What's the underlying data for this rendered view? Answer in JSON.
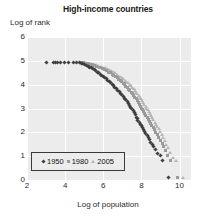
{
  "chart_data": {
    "type": "scatter",
    "title": "High-income countries",
    "xlabel": "Log of population",
    "ylabel": "Log of rank",
    "xlim": [
      2,
      10.6
    ],
    "ylim": [
      0,
      6
    ],
    "xticks": [
      "2",
      "4",
      "6",
      "8",
      "10"
    ],
    "xtick_values": [
      2,
      4,
      6,
      8,
      10
    ],
    "yticks": [
      "0",
      "1",
      "2",
      "3",
      "4",
      "5",
      "6"
    ],
    "ytick_values": [
      0,
      1,
      2,
      3,
      4,
      5,
      6
    ],
    "grid": true,
    "legend_position": "bottom-left",
    "plot_background": "#ececec",
    "gridline_color": "#ffffff",
    "series": [
      {
        "name": "1950",
        "marker": "diamond",
        "color": "#3f3f3f",
        "points": [
          [
            3.02,
            4.93
          ],
          [
            3.38,
            4.93
          ],
          [
            3.5,
            4.93
          ],
          [
            3.62,
            4.93
          ],
          [
            3.75,
            4.93
          ],
          [
            3.95,
            4.93
          ],
          [
            4.18,
            4.93
          ],
          [
            4.42,
            4.93
          ],
          [
            4.62,
            4.93
          ],
          [
            4.74,
            4.92
          ],
          [
            4.84,
            4.9
          ],
          [
            4.93,
            4.87
          ],
          [
            5.02,
            4.84
          ],
          [
            5.12,
            4.81
          ],
          [
            5.2,
            4.78
          ],
          [
            5.29,
            4.74
          ],
          [
            5.37,
            4.7
          ],
          [
            5.45,
            4.66
          ],
          [
            5.53,
            4.62
          ],
          [
            5.61,
            4.58
          ],
          [
            5.69,
            4.53
          ],
          [
            5.77,
            4.49
          ],
          [
            5.85,
            4.44
          ],
          [
            5.93,
            4.39
          ],
          [
            6.0,
            4.34
          ],
          [
            6.08,
            4.29
          ],
          [
            6.16,
            4.24
          ],
          [
            6.23,
            4.18
          ],
          [
            6.31,
            4.13
          ],
          [
            6.38,
            4.07
          ],
          [
            6.46,
            4.01
          ],
          [
            6.53,
            3.95
          ],
          [
            6.61,
            3.89
          ],
          [
            6.68,
            3.83
          ],
          [
            6.76,
            3.77
          ],
          [
            6.83,
            3.7
          ],
          [
            6.9,
            3.64
          ],
          [
            6.97,
            3.57
          ],
          [
            7.04,
            3.5
          ],
          [
            7.11,
            3.43
          ],
          [
            7.18,
            3.36
          ],
          [
            7.25,
            3.29
          ],
          [
            7.31,
            3.21
          ],
          [
            7.38,
            3.14
          ],
          [
            7.44,
            3.06
          ],
          [
            7.5,
            2.98
          ],
          [
            7.56,
            2.9
          ],
          [
            7.62,
            2.82
          ],
          [
            7.67,
            2.73
          ],
          [
            7.72,
            2.64
          ],
          [
            7.77,
            2.56
          ],
          [
            7.82,
            2.48
          ],
          [
            7.88,
            2.41
          ],
          [
            7.94,
            2.34
          ],
          [
            8.0,
            2.27
          ],
          [
            8.06,
            2.2
          ],
          [
            8.12,
            2.12
          ],
          [
            8.18,
            2.04
          ],
          [
            8.24,
            1.95
          ],
          [
            8.3,
            1.86
          ],
          [
            8.36,
            1.77
          ],
          [
            8.42,
            1.68
          ],
          [
            8.48,
            1.59
          ],
          [
            8.56,
            1.49
          ],
          [
            8.64,
            1.4
          ],
          [
            8.74,
            1.3
          ],
          [
            8.86,
            1.1
          ],
          [
            9.0,
            1.02
          ],
          [
            9.12,
            0.83
          ],
          [
            9.4,
            0.1
          ]
        ]
      },
      {
        "name": "1980",
        "marker": "square",
        "color": "#9a9a9a",
        "points": [
          [
            4.8,
            4.93
          ],
          [
            4.95,
            4.92
          ],
          [
            5.08,
            4.9
          ],
          [
            5.2,
            4.88
          ],
          [
            5.32,
            4.86
          ],
          [
            5.44,
            4.83
          ],
          [
            5.56,
            4.8
          ],
          [
            5.67,
            4.77
          ],
          [
            5.78,
            4.74
          ],
          [
            5.88,
            4.7
          ],
          [
            5.98,
            4.66
          ],
          [
            6.08,
            4.62
          ],
          [
            6.18,
            4.58
          ],
          [
            6.28,
            4.53
          ],
          [
            6.37,
            4.49
          ],
          [
            6.46,
            4.44
          ],
          [
            6.55,
            4.39
          ],
          [
            6.63,
            4.34
          ],
          [
            6.72,
            4.29
          ],
          [
            6.8,
            4.23
          ],
          [
            6.88,
            4.18
          ],
          [
            6.96,
            4.12
          ],
          [
            7.04,
            4.06
          ],
          [
            7.12,
            4.0
          ],
          [
            7.19,
            3.94
          ],
          [
            7.26,
            3.88
          ],
          [
            7.33,
            3.81
          ],
          [
            7.4,
            3.75
          ],
          [
            7.47,
            3.68
          ],
          [
            7.54,
            3.61
          ],
          [
            7.6,
            3.54
          ],
          [
            7.66,
            3.47
          ],
          [
            7.72,
            3.4
          ],
          [
            7.78,
            3.33
          ],
          [
            7.84,
            3.25
          ],
          [
            7.9,
            3.18
          ],
          [
            7.96,
            3.1
          ],
          [
            8.01,
            3.02
          ],
          [
            8.07,
            2.94
          ],
          [
            8.12,
            2.86
          ],
          [
            8.18,
            2.78
          ],
          [
            8.24,
            2.7
          ],
          [
            8.3,
            2.62
          ],
          [
            8.36,
            2.54
          ],
          [
            8.42,
            2.46
          ],
          [
            8.48,
            2.37
          ],
          [
            8.55,
            2.28
          ],
          [
            8.62,
            2.19
          ],
          [
            8.69,
            2.1
          ],
          [
            8.76,
            2.0
          ],
          [
            8.84,
            1.9
          ],
          [
            8.92,
            1.79
          ],
          [
            9.0,
            1.67
          ],
          [
            9.08,
            1.54
          ],
          [
            9.16,
            1.4
          ],
          [
            9.24,
            1.25
          ],
          [
            9.36,
            1.02
          ],
          [
            9.52,
            0.83
          ],
          [
            9.9,
            0.1
          ]
        ]
      },
      {
        "name": "2005",
        "marker": "triangle",
        "color": "#b4b4b4",
        "points": [
          [
            4.9,
            4.93
          ],
          [
            5.05,
            4.92
          ],
          [
            5.2,
            4.9
          ],
          [
            5.34,
            4.88
          ],
          [
            5.47,
            4.86
          ],
          [
            5.6,
            4.83
          ],
          [
            5.72,
            4.8
          ],
          [
            5.84,
            4.77
          ],
          [
            5.96,
            4.74
          ],
          [
            6.07,
            4.7
          ],
          [
            6.18,
            4.66
          ],
          [
            6.29,
            4.62
          ],
          [
            6.39,
            4.58
          ],
          [
            6.49,
            4.54
          ],
          [
            6.59,
            4.49
          ],
          [
            6.68,
            4.44
          ],
          [
            6.77,
            4.4
          ],
          [
            6.86,
            4.35
          ],
          [
            6.95,
            4.29
          ],
          [
            7.03,
            4.24
          ],
          [
            7.11,
            4.18
          ],
          [
            7.19,
            4.13
          ],
          [
            7.27,
            4.07
          ],
          [
            7.35,
            4.01
          ],
          [
            7.42,
            3.95
          ],
          [
            7.49,
            3.89
          ],
          [
            7.56,
            3.83
          ],
          [
            7.63,
            3.76
          ],
          [
            7.7,
            3.69
          ],
          [
            7.76,
            3.62
          ],
          [
            7.83,
            3.55
          ],
          [
            7.89,
            3.48
          ],
          [
            7.95,
            3.41
          ],
          [
            8.01,
            3.34
          ],
          [
            8.07,
            3.26
          ],
          [
            8.13,
            3.18
          ],
          [
            8.19,
            3.1
          ],
          [
            8.24,
            3.02
          ],
          [
            8.3,
            2.94
          ],
          [
            8.36,
            2.86
          ],
          [
            8.42,
            2.78
          ],
          [
            8.48,
            2.7
          ],
          [
            8.54,
            2.61
          ],
          [
            8.6,
            2.52
          ],
          [
            8.67,
            2.43
          ],
          [
            8.74,
            2.34
          ],
          [
            8.81,
            2.24
          ],
          [
            8.88,
            2.14
          ],
          [
            8.95,
            2.03
          ],
          [
            9.03,
            1.92
          ],
          [
            9.11,
            1.79
          ],
          [
            9.19,
            1.66
          ],
          [
            9.28,
            1.51
          ],
          [
            9.37,
            1.35
          ],
          [
            9.48,
            1.16
          ],
          [
            9.62,
            0.95
          ],
          [
            9.8,
            0.83
          ],
          [
            10.15,
            0.12
          ]
        ]
      }
    ]
  },
  "legend": {
    "entries": [
      {
        "label": "1950",
        "marker": "diamond",
        "color": "#3f3f3f"
      },
      {
        "label": "1980",
        "marker": "square",
        "color": "#9a9a9a"
      },
      {
        "label": "2005",
        "marker": "triangle",
        "color": "#b4b4b4"
      }
    ]
  }
}
